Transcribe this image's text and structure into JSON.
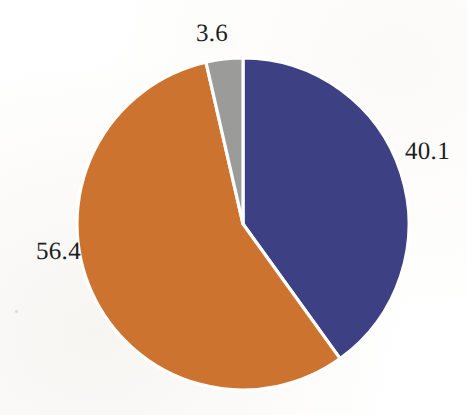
{
  "chart_data": {
    "type": "pie",
    "title": "",
    "subtitle": "",
    "xlabel": "",
    "ylabel": "",
    "legend_position": "none",
    "grid": false,
    "start_angle_deg": 0,
    "direction": "clockwise",
    "categories": [
      "40.1",
      "56.4",
      "3.6"
    ],
    "values": [
      40.1,
      56.4,
      3.6
    ],
    "total": 100.1,
    "slices": [
      {
        "id": "slice-blue",
        "label": "40.1",
        "value": 40.1,
        "color": "#3d4184",
        "start_deg": 0.0,
        "end_deg": 144.2,
        "label_position": "right"
      },
      {
        "id": "slice-orange",
        "label": "56.4",
        "value": 56.4,
        "color": "#cd7330",
        "start_deg": 144.2,
        "end_deg": 347.1,
        "label_position": "left"
      },
      {
        "id": "slice-gray",
        "label": "3.6",
        "value": 3.6,
        "color": "#9b9b99",
        "start_deg": 347.1,
        "end_deg": 360.0,
        "label_position": "top"
      }
    ],
    "data_labels": [
      {
        "name": "gray-slice-value",
        "text": "3.6"
      },
      {
        "name": "blue-slice-value",
        "text": "40.1"
      },
      {
        "name": "orange-slice-value",
        "text": "56.4"
      }
    ],
    "colors": {
      "blue": "#3d4184",
      "orange": "#cd7330",
      "gray": "#9b9b99",
      "separator": "#ffffff",
      "background": "#ffffff",
      "label_text": "#1d1d1f"
    },
    "geometry": {
      "center_x": 243,
      "center_y": 224,
      "radius": 166
    }
  }
}
